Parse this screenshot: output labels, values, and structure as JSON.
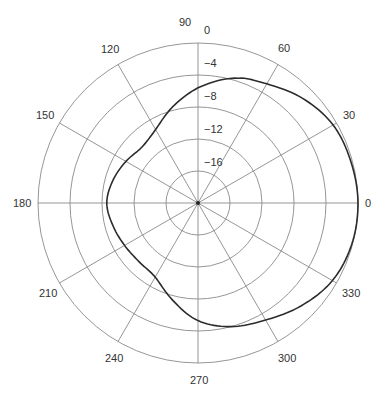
{
  "chart_data": {
    "type": "polar-line",
    "title": "",
    "angular_axis": {
      "unit": "degrees",
      "ticks": [
        0,
        30,
        60,
        90,
        120,
        150,
        180,
        210,
        240,
        270,
        300,
        330
      ],
      "tick_labels": [
        "0",
        "30",
        "60",
        "90",
        "120",
        "150",
        "180",
        "210",
        "240",
        "270",
        "300",
        "330"
      ],
      "direction": "counterclockwise",
      "zero_location": "east"
    },
    "radial_axis": {
      "unit": "dB",
      "range": [
        -20,
        0
      ],
      "ticks": [
        0,
        -4,
        -8,
        -12,
        -16
      ],
      "tick_labels": [
        "0",
        "−4",
        "−8",
        "−12",
        "−16"
      ],
      "label_angle_deg": 90
    },
    "grid": true,
    "legend": null,
    "series": [
      {
        "name": "radiation pattern",
        "color": "#2b2b2b",
        "angles": [
          0,
          15,
          30,
          45,
          60,
          72,
          90,
          105,
          120,
          135,
          150,
          165,
          180,
          195,
          210,
          225,
          240,
          255,
          270,
          285,
          300,
          315,
          330,
          345,
          360
        ],
        "values": [
          0.0,
          -0.2,
          -0.5,
          -1.5,
          -2.8,
          -3.6,
          -5.6,
          -7.6,
          -9.4,
          -10.1,
          -9.6,
          -9.0,
          -8.6,
          -9.0,
          -9.4,
          -9.6,
          -9.3,
          -7.5,
          -5.3,
          -4.0,
          -3.1,
          -1.8,
          -0.6,
          -0.1,
          0.0
        ]
      }
    ]
  },
  "labels": {
    "angle": {
      "a0": "0",
      "a30": "30",
      "a60": "60",
      "a90": "90",
      "a120": "120",
      "a150": "150",
      "a180": "180",
      "a210": "210",
      "a240": "240",
      "a270": "270",
      "a300": "300",
      "a330": "330"
    },
    "radial": {
      "r0": "0",
      "r4": "−4",
      "r8": "−8",
      "r12": "−12",
      "r16": "−16"
    }
  }
}
